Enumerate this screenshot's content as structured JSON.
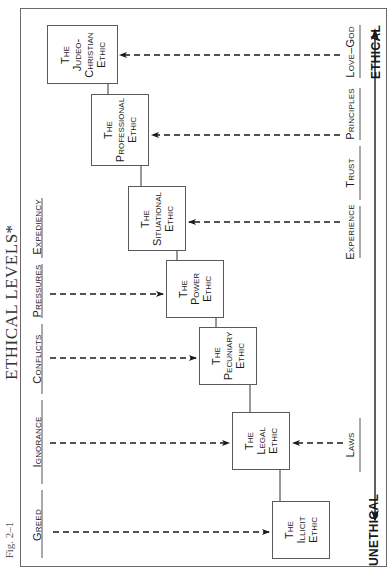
{
  "figure": {
    "label": "Fig. 2–1",
    "title": "ETHICAL LEVELS*"
  },
  "axis": {
    "top_label": "ETHICAL",
    "bottom_label": "UNETHICAL"
  },
  "boxes": [
    {
      "id": "judeo-christian",
      "lines": [
        "The",
        "Judeo-",
        "Christian",
        "Ethic"
      ]
    },
    {
      "id": "professional",
      "lines": [
        "The",
        "Professional",
        "Ethic"
      ]
    },
    {
      "id": "situational",
      "lines": [
        "The",
        "Situational",
        "Ethic"
      ]
    },
    {
      "id": "power",
      "lines": [
        "The",
        "Power",
        "Ethic"
      ]
    },
    {
      "id": "pecuniary",
      "lines": [
        "The",
        "Pecuniary",
        "Ethic"
      ]
    },
    {
      "id": "legal",
      "lines": [
        "The",
        "Legal",
        "Ethic"
      ]
    },
    {
      "id": "illicit",
      "lines": [
        "The",
        "Illicit",
        "Ethic"
      ]
    }
  ],
  "left_influences": [
    {
      "label": "Expediency",
      "target": "power"
    },
    {
      "label": "Pressures",
      "target": "pecuniary"
    },
    {
      "label": "Conflicts",
      "target": "legal"
    },
    {
      "label": "Ignorance",
      "target": "legal"
    },
    {
      "label": "Greed",
      "target": "illicit"
    }
  ],
  "right_influences": [
    {
      "label": "Love–God",
      "target": "judeo-christian"
    },
    {
      "label": "Principles",
      "target": "professional"
    },
    {
      "label": "Trust",
      "target": "professional"
    },
    {
      "label": "Experience",
      "target": "situational"
    },
    {
      "label": "Laws",
      "target": "legal"
    }
  ],
  "colors": {
    "line": "#1a1a1a",
    "frame": "#6a6a6a",
    "background": "#ffffff"
  }
}
